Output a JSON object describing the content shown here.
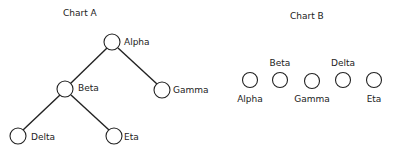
{
  "chart_a": {
    "title": "Chart A",
    "nodes": [
      {
        "id": "alpha",
        "label": "Alpha"
      },
      {
        "id": "beta",
        "label": "Beta"
      },
      {
        "id": "gamma",
        "label": "Gamma"
      },
      {
        "id": "delta",
        "label": "Delta"
      },
      {
        "id": "eta",
        "label": "Eta"
      }
    ],
    "edges": [
      [
        "Alpha",
        "Beta"
      ],
      [
        "Alpha",
        "Gamma"
      ],
      [
        "Beta",
        "Delta"
      ],
      [
        "Beta",
        "Eta"
      ]
    ]
  },
  "chart_b": {
    "title": "Chart B",
    "nodes": [
      {
        "label": "Alpha",
        "label_position": "below"
      },
      {
        "label": "Beta",
        "label_position": "above"
      },
      {
        "label": "Gamma",
        "label_position": "below"
      },
      {
        "label": "Delta",
        "label_position": "above"
      },
      {
        "label": "Eta",
        "label_position": "below"
      }
    ]
  }
}
